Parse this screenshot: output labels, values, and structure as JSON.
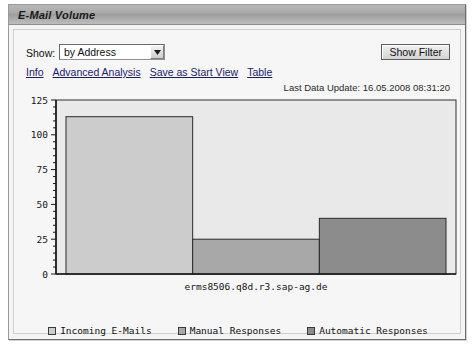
{
  "window": {
    "title": "E-Mail Volume"
  },
  "toolbar": {
    "show_label": "Show:",
    "show_selected": "by Address",
    "show_options": [
      "by Address"
    ],
    "dropdown_icon": "chevron-down-icon",
    "show_filter_label": "Show Filter"
  },
  "links": [
    {
      "label": "Info"
    },
    {
      "label": "Advanced Analysis"
    },
    {
      "label": "Save as Start View"
    },
    {
      "label": "Table"
    }
  ],
  "status": {
    "last_data_update": "Last Data Update: 16.05.2008 08:31:20"
  },
  "chart_data": {
    "type": "bar",
    "title": "",
    "xlabel": "erms8506.q8d.r3.sap-ag.de",
    "ylabel": "",
    "categories": [
      "erms8506.q8d.r3.sap-ag.de"
    ],
    "x_tick_labels": [
      "erms8506.q8d.r3.sap-ag.de"
    ],
    "y_tick_labels": [
      "0",
      "25",
      "50",
      "75",
      "100",
      "125"
    ],
    "y_ticks": [
      0,
      25,
      50,
      75,
      100,
      125
    ],
    "ylim": [
      0,
      125
    ],
    "minor_tick_step": 5,
    "grid": false,
    "legend_position": "bottom",
    "plot_background": "#e9e9e9",
    "series": [
      {
        "name": "Incoming E-Mails",
        "values": [
          113
        ],
        "color": "#cccccc"
      },
      {
        "name": "Manual Responses",
        "values": [
          25
        ],
        "color": "#a8a8a8"
      },
      {
        "name": "Automatic Responses",
        "values": [
          40
        ],
        "color": "#8c8c8c"
      }
    ]
  },
  "legend": [
    {
      "label": "Incoming E-Mails",
      "color": "#cccccc"
    },
    {
      "label": "Manual Responses",
      "color": "#a8a8a8"
    },
    {
      "label": "Automatic Responses",
      "color": "#8c8c8c"
    }
  ]
}
